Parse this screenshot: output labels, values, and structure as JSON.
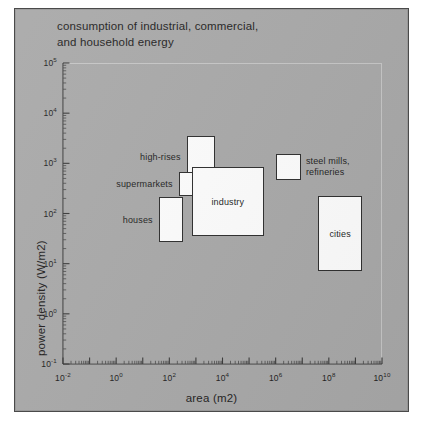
{
  "figure": {
    "title": "consumption of industrial, commercial,\nand household energy",
    "background_color": "#a9a9a9",
    "box_fill": "#fdfdfd",
    "box_stroke": "#2e2e2e",
    "text_color": "#241f1f"
  },
  "chart_data": {
    "type": "scatter",
    "title": "consumption of industrial, commercial, and household energy",
    "xlabel": "area (m2)",
    "ylabel": "power density (W/m2)",
    "xscale": "log",
    "yscale": "log",
    "xlim": [
      -2,
      10
    ],
    "ylim": [
      -1,
      5
    ],
    "grid": false,
    "legend": "none",
    "xticks": [
      "10-2",
      "100",
      "102",
      "104",
      "106",
      "108",
      "1010"
    ],
    "xtick_exponents": [
      -2,
      0,
      2,
      4,
      6,
      8,
      10
    ],
    "yticks": [
      "10-1",
      "100",
      "101",
      "102",
      "103",
      "104",
      "105"
    ],
    "ytick_exponents": [
      -1,
      0,
      1,
      2,
      3,
      4,
      5
    ],
    "boxes": [
      {
        "name": "high-rises",
        "label": "high-rises",
        "label_position": "left",
        "x_range": [
          2.65,
          3.7
        ],
        "y_range": [
          2.72,
          3.55
        ]
      },
      {
        "name": "supermarkets",
        "label": "supermarkets",
        "label_position": "left",
        "x_range": [
          2.35,
          3.4
        ],
        "y_range": [
          2.35,
          2.82
        ]
      },
      {
        "name": "houses",
        "label": "houses",
        "label_position": "left",
        "x_range": [
          1.6,
          2.5
        ],
        "y_range": [
          1.43,
          2.32
        ]
      },
      {
        "name": "industry",
        "label": "industry",
        "label_position": "inside",
        "x_range": [
          2.85,
          5.55
        ],
        "y_range": [
          1.55,
          2.92
        ]
      },
      {
        "name": "steel-mills-refineries",
        "label": "steel mills,\nrefineries",
        "label_position": "right",
        "x_range": [
          6.0,
          6.95
        ],
        "y_range": [
          2.67,
          3.18
        ]
      },
      {
        "name": "cities",
        "label": "cities",
        "label_position": "inside",
        "x_range": [
          7.6,
          9.25
        ],
        "y_range": [
          0.85,
          2.35
        ]
      }
    ]
  }
}
